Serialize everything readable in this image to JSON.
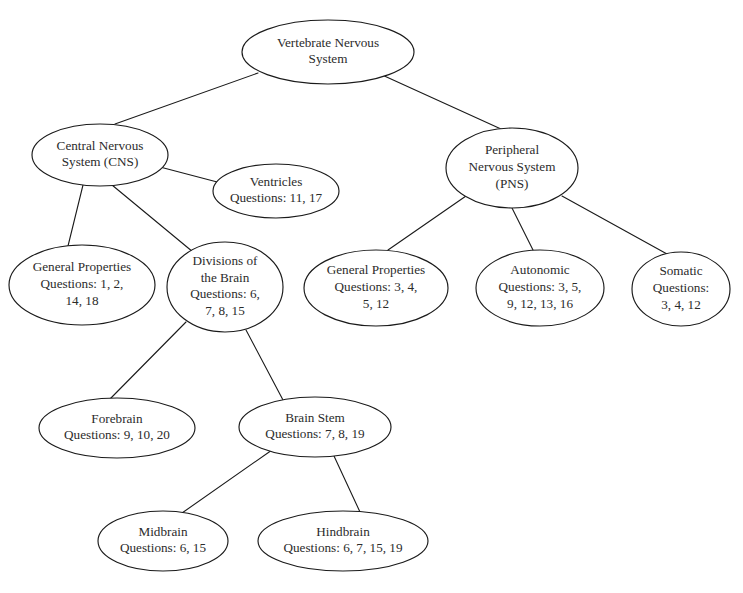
{
  "diagram": {
    "type": "concept-map-tree",
    "background_color": "#ffffff",
    "stroke_color": "#1a1a1a",
    "text_color": "#2b2b2b",
    "nodes": [
      {
        "id": "vertebrate-nervous-system",
        "lines": [
          "Vertebrate Nervous",
          "System"
        ],
        "cx": 328,
        "cy": 52,
        "rx": 86,
        "ry": 32
      },
      {
        "id": "central-nervous-system",
        "lines": [
          "Central Nervous",
          "System (CNS)"
        ],
        "cx": 100,
        "cy": 155,
        "rx": 68,
        "ry": 31
      },
      {
        "id": "peripheral-nervous-system",
        "lines": [
          "Peripheral",
          "Nervous System",
          "(PNS)"
        ],
        "cx": 512,
        "cy": 168,
        "rx": 66,
        "ry": 40
      },
      {
        "id": "ventricles",
        "lines": [
          "Ventricles",
          "Questions: 11, 17"
        ],
        "cx": 276,
        "cy": 191,
        "rx": 63,
        "ry": 27
      },
      {
        "id": "cns-general-properties",
        "lines": [
          "General Properties",
          "Questions: 1, 2,",
          "14, 18"
        ],
        "cx": 82,
        "cy": 285,
        "rx": 73,
        "ry": 40
      },
      {
        "id": "divisions-of-the-brain",
        "lines": [
          "Divisions of",
          "the Brain",
          "Questions: 6,",
          "7, 8, 15"
        ],
        "cx": 225,
        "cy": 287,
        "rx": 58,
        "ry": 45
      },
      {
        "id": "pns-general-properties",
        "lines": [
          "General Properties",
          "Questions: 3, 4,",
          "5, 12"
        ],
        "cx": 376,
        "cy": 288,
        "rx": 72,
        "ry": 38
      },
      {
        "id": "autonomic",
        "lines": [
          "Autonomic",
          "Questions: 3, 5,",
          "9, 12, 13, 16"
        ],
        "cx": 540,
        "cy": 288,
        "rx": 64,
        "ry": 38
      },
      {
        "id": "somatic",
        "lines": [
          "Somatic",
          "Questions:",
          "3, 4, 12"
        ],
        "cx": 681,
        "cy": 289,
        "rx": 49,
        "ry": 37
      },
      {
        "id": "forebrain",
        "lines": [
          "Forebrain",
          "Questions: 9, 10, 20"
        ],
        "cx": 117,
        "cy": 428,
        "rx": 78,
        "ry": 30
      },
      {
        "id": "brain-stem",
        "lines": [
          "Brain Stem",
          "Questions: 7, 8, 19"
        ],
        "cx": 315,
        "cy": 427,
        "rx": 76,
        "ry": 30
      },
      {
        "id": "midbrain",
        "lines": [
          "Midbrain",
          "Questions: 6, 15"
        ],
        "cx": 163,
        "cy": 541,
        "rx": 65,
        "ry": 30
      },
      {
        "id": "hindbrain",
        "lines": [
          "Hindbrain",
          "Questions: 6, 7, 15, 19"
        ],
        "cx": 343,
        "cy": 541,
        "rx": 85,
        "ry": 30
      }
    ],
    "edges": [
      {
        "id": "edge-root-to-cns",
        "from": "vertebrate-nervous-system",
        "to": "central-nervous-system",
        "x1": 258,
        "y1": 73,
        "x2": 115,
        "y2": 124
      },
      {
        "id": "edge-root-to-pns",
        "from": "vertebrate-nervous-system",
        "to": "peripheral-nervous-system",
        "x1": 380,
        "y1": 74,
        "x2": 501,
        "y2": 129
      },
      {
        "id": "edge-cns-to-ventricles",
        "from": "central-nervous-system",
        "to": "ventricles",
        "x1": 160,
        "y1": 167,
        "x2": 221,
        "y2": 183
      },
      {
        "id": "edge-cns-to-general-properties",
        "from": "central-nervous-system",
        "to": "cns-general-properties",
        "x1": 83,
        "y1": 185,
        "x2": 68,
        "y2": 246
      },
      {
        "id": "edge-cns-to-divisions",
        "from": "central-nervous-system",
        "to": "divisions-of-the-brain",
        "x1": 112,
        "y1": 185,
        "x2": 193,
        "y2": 252
      },
      {
        "id": "edge-pns-to-general-properties",
        "from": "peripheral-nervous-system",
        "to": "pns-general-properties",
        "x1": 466,
        "y1": 196,
        "x2": 388,
        "y2": 250
      },
      {
        "id": "edge-pns-to-autonomic",
        "from": "peripheral-nervous-system",
        "to": "autonomic",
        "x1": 512,
        "y1": 208,
        "x2": 533,
        "y2": 250
      },
      {
        "id": "edge-pns-to-somatic",
        "from": "peripheral-nervous-system",
        "to": "somatic",
        "x1": 562,
        "y1": 196,
        "x2": 667,
        "y2": 254
      },
      {
        "id": "edge-divisions-to-forebrain",
        "from": "divisions-of-the-brain",
        "to": "forebrain",
        "x1": 186,
        "y1": 322,
        "x2": 109,
        "y2": 400
      },
      {
        "id": "edge-divisions-to-brain-stem",
        "from": "divisions-of-the-brain",
        "to": "brain-stem",
        "x1": 246,
        "y1": 330,
        "x2": 283,
        "y2": 400
      },
      {
        "id": "edge-brain-stem-to-midbrain",
        "from": "brain-stem",
        "to": "midbrain",
        "x1": 272,
        "y1": 450,
        "x2": 182,
        "y2": 513
      },
      {
        "id": "edge-brain-stem-to-hindbrain",
        "from": "brain-stem",
        "to": "hindbrain",
        "x1": 334,
        "y1": 456,
        "x2": 360,
        "y2": 512
      }
    ]
  }
}
